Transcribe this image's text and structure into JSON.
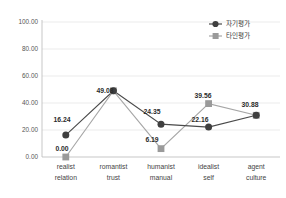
{
  "chart_data": {
    "type": "line",
    "title": "",
    "xlabel": "",
    "ylabel": "",
    "ylim": [
      0,
      100
    ],
    "yticks": [
      "0.00",
      "20.00",
      "40.00",
      "60.00",
      "80.00",
      "100.00"
    ],
    "ytick_values": [
      0,
      20,
      40,
      60,
      80,
      100
    ],
    "grid": true,
    "legend_position": "top-right",
    "categories": [
      {
        "line1": "realist",
        "line2": "relation"
      },
      {
        "line1": "romantist",
        "line2": "trust"
      },
      {
        "line1": "humanist",
        "line2": "manual"
      },
      {
        "line1": "idealist",
        "line2": "self"
      },
      {
        "line1": "agent",
        "line2": "culture"
      }
    ],
    "series": [
      {
        "name": "자기평가",
        "marker": "circle",
        "color": "#3f3f3f",
        "line_color": "#4a4a4a",
        "values": [
          16.24,
          49.03,
          24.35,
          22.16,
          30.88
        ],
        "labels": [
          "16.24",
          "49.03",
          "24.35",
          "22.16",
          "30.88"
        ]
      },
      {
        "name": "타인평가",
        "marker": "square",
        "color": "#9a9a9a",
        "line_color": "#a6a6a6",
        "values": [
          0.0,
          49.03,
          6.19,
          39.56,
          30.88
        ],
        "labels": [
          "0.00",
          "49.03",
          "6.19",
          "39.56",
          "30.88"
        ]
      }
    ],
    "visible_data_labels": [
      {
        "text": "16.24",
        "x": 62,
        "y": 122
      },
      {
        "text": "0.00",
        "x": 62,
        "y": 151
      },
      {
        "text": "49.03",
        "x": 105,
        "y": 93
      },
      {
        "text": "24.35",
        "x": 152,
        "y": 114
      },
      {
        "text": "6.19",
        "x": 152,
        "y": 142
      },
      {
        "text": "39.56",
        "x": 203,
        "y": 98
      },
      {
        "text": "22.16",
        "x": 200,
        "y": 122
      },
      {
        "text": "30.88",
        "x": 250,
        "y": 107
      }
    ]
  }
}
